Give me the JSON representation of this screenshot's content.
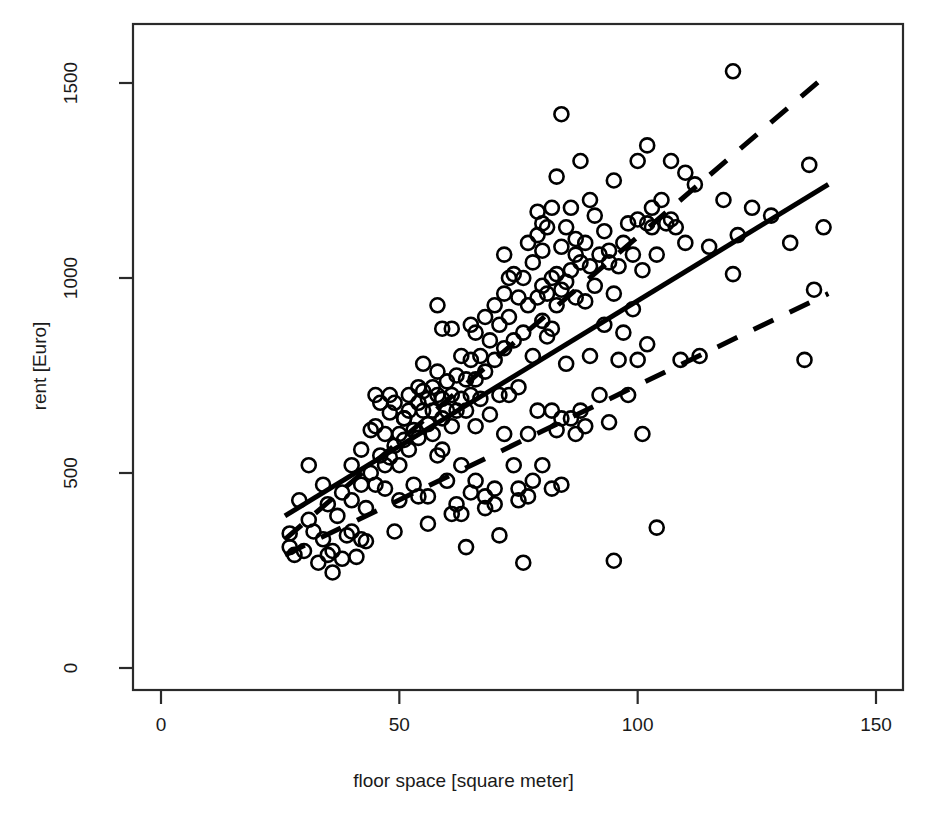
{
  "chart_data": {
    "type": "scatter",
    "title": "",
    "xlabel": "floor space [square meter]",
    "ylabel": "rent [Euro]",
    "xlim": [
      0,
      150
    ],
    "ylim": [
      0,
      1650
    ],
    "xticks": [
      0,
      50,
      100,
      150
    ],
    "xtick_labels": [
      "0",
      "50",
      "100",
      "150"
    ],
    "yticks": [
      0,
      500,
      1000,
      1500
    ],
    "ytick_labels": [
      "0",
      "500",
      "1000",
      "1500"
    ],
    "grid": false,
    "legend": "none",
    "marker": "open-circle",
    "marker_radius_px": 7,
    "series": [
      {
        "name": "observations",
        "type": "scatter",
        "points": [
          [
            27,
            310
          ],
          [
            27,
            345
          ],
          [
            28,
            290
          ],
          [
            29,
            430
          ],
          [
            30,
            300
          ],
          [
            31,
            520
          ],
          [
            31,
            380
          ],
          [
            32,
            350
          ],
          [
            33,
            270
          ],
          [
            34,
            330
          ],
          [
            34,
            470
          ],
          [
            35,
            420
          ],
          [
            36,
            245
          ],
          [
            36,
            300
          ],
          [
            37,
            390
          ],
          [
            38,
            450
          ],
          [
            38,
            280
          ],
          [
            39,
            340
          ],
          [
            40,
            520
          ],
          [
            40,
            430
          ],
          [
            41,
            285
          ],
          [
            42,
            470
          ],
          [
            42,
            560
          ],
          [
            43,
            410
          ],
          [
            43,
            325
          ],
          [
            44,
            500
          ],
          [
            45,
            470
          ],
          [
            45,
            620
          ],
          [
            46,
            545
          ],
          [
            46,
            680
          ],
          [
            47,
            460
          ],
          [
            47,
            600
          ],
          [
            48,
            655
          ],
          [
            48,
            700
          ],
          [
            48,
            540
          ],
          [
            49,
            570
          ],
          [
            49,
            680
          ],
          [
            50,
            600
          ],
          [
            50,
            520
          ],
          [
            50,
            430
          ],
          [
            51,
            640
          ],
          [
            51,
            585
          ],
          [
            52,
            700
          ],
          [
            52,
            560
          ],
          [
            53,
            470
          ],
          [
            53,
            610
          ],
          [
            54,
            680
          ],
          [
            54,
            720
          ],
          [
            54,
            590
          ],
          [
            55,
            660
          ],
          [
            55,
            710
          ],
          [
            55,
            780
          ],
          [
            56,
            625
          ],
          [
            56,
            690
          ],
          [
            56,
            440
          ],
          [
            57,
            720
          ],
          [
            57,
            660
          ],
          [
            57,
            600
          ],
          [
            58,
            700
          ],
          [
            58,
            760
          ],
          [
            58,
            545
          ],
          [
            59,
            690
          ],
          [
            59,
            640
          ],
          [
            59,
            870
          ],
          [
            60,
            735
          ],
          [
            60,
            660
          ],
          [
            60,
            480
          ],
          [
            61,
            700
          ],
          [
            61,
            620
          ],
          [
            61,
            870
          ],
          [
            62,
            750
          ],
          [
            62,
            660
          ],
          [
            62,
            420
          ],
          [
            63,
            800
          ],
          [
            63,
            690
          ],
          [
            63,
            520
          ],
          [
            64,
            740
          ],
          [
            64,
            660
          ],
          [
            64,
            310
          ],
          [
            65,
            790
          ],
          [
            65,
            700
          ],
          [
            65,
            450
          ],
          [
            66,
            860
          ],
          [
            66,
            740
          ],
          [
            66,
            620
          ],
          [
            67,
            800
          ],
          [
            67,
            690
          ],
          [
            68,
            900
          ],
          [
            68,
            760
          ],
          [
            68,
            440
          ],
          [
            69,
            840
          ],
          [
            69,
            650
          ],
          [
            70,
            930
          ],
          [
            70,
            790
          ],
          [
            70,
            460
          ],
          [
            71,
            880
          ],
          [
            71,
            700
          ],
          [
            71,
            340
          ],
          [
            72,
            960
          ],
          [
            72,
            820
          ],
          [
            72,
            600
          ],
          [
            73,
            900
          ],
          [
            73,
            700
          ],
          [
            74,
            1010
          ],
          [
            74,
            840
          ],
          [
            74,
            520
          ],
          [
            75,
            950
          ],
          [
            75,
            720
          ],
          [
            75,
            460
          ],
          [
            76,
            1000
          ],
          [
            76,
            860
          ],
          [
            76,
            270
          ],
          [
            77,
            1090
          ],
          [
            77,
            930
          ],
          [
            77,
            600
          ],
          [
            78,
            1040
          ],
          [
            78,
            800
          ],
          [
            78,
            480
          ],
          [
            79,
            1110
          ],
          [
            79,
            950
          ],
          [
            79,
            660
          ],
          [
            80,
            1070
          ],
          [
            80,
            890
          ],
          [
            80,
            980
          ],
          [
            80,
            520
          ],
          [
            81,
            1130
          ],
          [
            81,
            960
          ],
          [
            81,
            850
          ],
          [
            82,
            1180
          ],
          [
            82,
            1000
          ],
          [
            82,
            870
          ],
          [
            82,
            660
          ],
          [
            83,
            1260
          ],
          [
            83,
            1010
          ],
          [
            83,
            930
          ],
          [
            83,
            610
          ],
          [
            84,
            1420
          ],
          [
            84,
            1080
          ],
          [
            84,
            970
          ],
          [
            84,
            640
          ],
          [
            85,
            1130
          ],
          [
            85,
            990
          ],
          [
            85,
            780
          ],
          [
            86,
            1180
          ],
          [
            86,
            1020
          ],
          [
            86,
            640
          ],
          [
            87,
            1100
          ],
          [
            87,
            950
          ],
          [
            87,
            600
          ],
          [
            88,
            1300
          ],
          [
            88,
            1040
          ],
          [
            88,
            660
          ],
          [
            89,
            1090
          ],
          [
            89,
            940
          ],
          [
            89,
            620
          ],
          [
            90,
            1200
          ],
          [
            90,
            1030
          ],
          [
            90,
            800
          ],
          [
            91,
            1160
          ],
          [
            91,
            980
          ],
          [
            92,
            1060
          ],
          [
            92,
            700
          ],
          [
            93,
            1120
          ],
          [
            93,
            880
          ],
          [
            94,
            1040
          ],
          [
            94,
            630
          ],
          [
            95,
            1250
          ],
          [
            95,
            960
          ],
          [
            95,
            275
          ],
          [
            96,
            1030
          ],
          [
            96,
            790
          ],
          [
            97,
            1090
          ],
          [
            97,
            860
          ],
          [
            98,
            1140
          ],
          [
            98,
            700
          ],
          [
            99,
            1060
          ],
          [
            99,
            920
          ],
          [
            100,
            1300
          ],
          [
            100,
            1150
          ],
          [
            100,
            790
          ],
          [
            101,
            1020
          ],
          [
            101,
            600
          ],
          [
            102,
            1340
          ],
          [
            102,
            1140
          ],
          [
            102,
            830
          ],
          [
            103,
            1180
          ],
          [
            103,
            1130
          ],
          [
            104,
            1060
          ],
          [
            104,
            360
          ],
          [
            105,
            1200
          ],
          [
            106,
            1140
          ],
          [
            107,
            1300
          ],
          [
            107,
            1150
          ],
          [
            108,
            1130
          ],
          [
            109,
            790
          ],
          [
            110,
            1270
          ],
          [
            110,
            1090
          ],
          [
            112,
            1240
          ],
          [
            113,
            800
          ],
          [
            115,
            1080
          ],
          [
            118,
            1200
          ],
          [
            120,
            1530
          ],
          [
            120,
            1010
          ],
          [
            121,
            1110
          ],
          [
            124,
            1180
          ],
          [
            128,
            1160
          ],
          [
            132,
            1090
          ],
          [
            135,
            790
          ],
          [
            136,
            1290
          ],
          [
            137,
            970
          ],
          [
            139,
            1130
          ],
          [
            45,
            700
          ],
          [
            52,
            660
          ],
          [
            59,
            560
          ],
          [
            66,
            480
          ],
          [
            73,
            1000
          ],
          [
            80,
            1140
          ],
          [
            87,
            1060
          ],
          [
            94,
            1070
          ],
          [
            44,
            610
          ],
          [
            51,
            640
          ],
          [
            58,
            930
          ],
          [
            65,
            880
          ],
          [
            72,
            1060
          ],
          [
            79,
            1170
          ],
          [
            40,
            350
          ],
          [
            47,
            520
          ],
          [
            54,
            440
          ],
          [
            61,
            395
          ],
          [
            68,
            410
          ],
          [
            75,
            430
          ],
          [
            82,
            460
          ],
          [
            35,
            290
          ],
          [
            42,
            330
          ],
          [
            49,
            350
          ],
          [
            56,
            370
          ],
          [
            63,
            395
          ],
          [
            70,
            420
          ],
          [
            77,
            440
          ],
          [
            84,
            470
          ]
        ]
      }
    ],
    "lines": [
      {
        "name": "regression-line",
        "style": "solid",
        "width_px": 5,
        "x": [
          26,
          140
        ],
        "y": [
          390,
          1240
        ]
      },
      {
        "name": "upper-band",
        "style": "dashed",
        "width_px": 5,
        "x": [
          26,
          140
        ],
        "y": [
          330,
          1525
        ]
      },
      {
        "name": "lower-band",
        "style": "dashed",
        "width_px": 5,
        "x": [
          26,
          140
        ],
        "y": [
          290,
          960
        ]
      }
    ],
    "colors": {
      "marker_stroke": "#000000",
      "line": "#000000",
      "axis": "#2a2a2a",
      "background": "#ffffff"
    }
  }
}
